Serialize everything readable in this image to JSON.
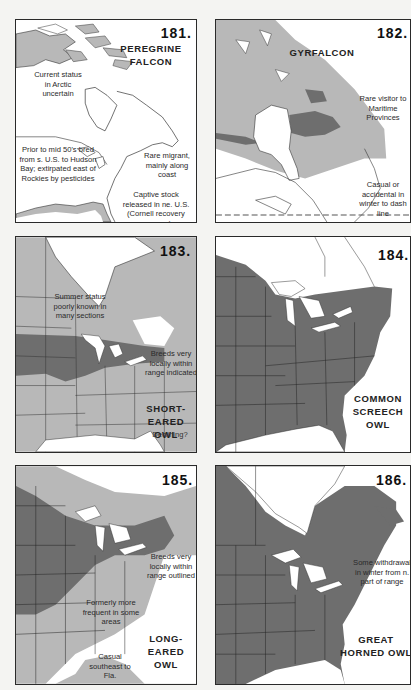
{
  "colors": {
    "page_bg": "#f4f4f2",
    "panel_bg": "#ffffff",
    "range_light": "#b8b8b8",
    "range_dark": "#6e6e6e",
    "border": "#2a2a2a"
  },
  "panels": [
    {
      "number": "181.",
      "title_lines": [
        "PEREGRINE",
        "FALCON"
      ],
      "notes": [
        "Current status in Arctic uncertain",
        "Prior to mid 50's bred from s. U.S. to Hudson Bay; extirpated east of Rockies by pesticides",
        "Rare migrant, mainly along coast",
        "Captive stock released in ne. U.S. (Cornell recovery program)"
      ]
    },
    {
      "number": "182.",
      "title_lines": [
        "GYRFALCON"
      ],
      "notes": [
        "Rare visitor to Maritime Provinces",
        "Casual or accidental in winter to dash line"
      ]
    },
    {
      "number": "183.",
      "title_lines": [
        "SHORT-EARED",
        "OWL"
      ],
      "subtitle": "Declining?",
      "notes": [
        "Summer status poorly known in many sections",
        "Breeds very locally within range indicated"
      ]
    },
    {
      "number": "184.",
      "title_lines": [
        "COMMON",
        "SCREECH",
        "OWL"
      ],
      "notes": []
    },
    {
      "number": "185.",
      "title_lines": [
        "LONG-EARED",
        "OWL"
      ],
      "notes": [
        "Breeds very locally within range outlined",
        "Formerly more frequent in some areas",
        "Casual southeast to Fla."
      ]
    },
    {
      "number": "186.",
      "title_lines": [
        "GREAT",
        "HORNED OWL"
      ],
      "notes": [
        "Some withdrawal in winter from n. part of range"
      ]
    }
  ]
}
